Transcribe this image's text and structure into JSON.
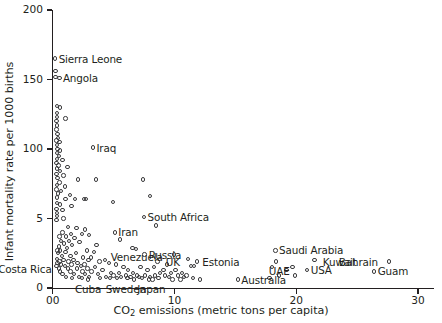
{
  "chart_data": {
    "type": "scatter",
    "title": "",
    "xlabel": "CO2 emissions (metric tons per capita)",
    "xlabel_main": "CO",
    "xlabel_sub": "2",
    "xlabel_rest": " emissions (metric tons per capita)",
    "ylabel": "Infant mortality rate per 1000 births",
    "xlim": [
      0,
      31.5
    ],
    "ylim": [
      0,
      212
    ],
    "grid": false,
    "legend": null,
    "marker": "open-circle",
    "marker_color": "#3a3a3c",
    "xticks": [
      0,
      10,
      20,
      30
    ],
    "xticklabels": [
      "00",
      "10",
      "20",
      "30"
    ],
    "yticks": [
      0,
      50,
      100,
      150,
      200
    ],
    "yticklabels": [
      "0",
      "5",
      "100",
      "150",
      "200"
    ],
    "annotations": [
      {
        "label": "Sierra Leone",
        "x": 0.2,
        "y": 165,
        "align": "right"
      },
      {
        "label": "Angola",
        "x": 0.55,
        "y": 151,
        "align": "right"
      },
      {
        "label": "Iraq",
        "x": 3.3,
        "y": 101,
        "align": "right"
      },
      {
        "label": "South Africa",
        "x": 7.5,
        "y": 51,
        "align": "right"
      },
      {
        "label": "Iran",
        "x": 5.1,
        "y": 40,
        "align": "right"
      },
      {
        "label": "Venezuela",
        "x": 6.9,
        "y": 29,
        "align": "below"
      },
      {
        "label": "Russia",
        "x": 7.6,
        "y": 24,
        "align": "right"
      },
      {
        "label": "UK",
        "x": 9.0,
        "y": 19,
        "align": "right"
      },
      {
        "label": "Estonia",
        "x": 12.0,
        "y": 19,
        "align": "right"
      },
      {
        "label": "Saudi Arabia",
        "x": 18.3,
        "y": 27,
        "align": "right"
      },
      {
        "label": "UAE",
        "x": 18.6,
        "y": 19,
        "align": "below"
      },
      {
        "label": "USA",
        "x": 20.9,
        "y": 13,
        "align": "right"
      },
      {
        "label": "Kuwait",
        "x": 21.9,
        "y": 19,
        "align": "right"
      },
      {
        "label": "Bahrain",
        "x": 27.0,
        "y": 19,
        "align": "left"
      },
      {
        "label": "Guam",
        "x": 26.4,
        "y": 12,
        "align": "right"
      },
      {
        "label": "Costa Rica",
        "x": 0.2,
        "y": 14,
        "align": "left"
      },
      {
        "label": "Cuba",
        "x": 2.9,
        "y": 6,
        "align": "below"
      },
      {
        "label": "Sweden",
        "x": 6.0,
        "y": 6,
        "align": "below"
      },
      {
        "label": "Japan",
        "x": 8.1,
        "y": 6,
        "align": "below"
      },
      {
        "label": "Australia",
        "x": 15.2,
        "y": 6,
        "align": "right"
      }
    ],
    "points": [
      {
        "x": 0.2,
        "y": 165
      },
      {
        "x": 0.22,
        "y": 156
      },
      {
        "x": 0.22,
        "y": 152
      },
      {
        "x": 0.55,
        "y": 151
      },
      {
        "x": 0.35,
        "y": 131
      },
      {
        "x": 0.6,
        "y": 130
      },
      {
        "x": 0.33,
        "y": 126
      },
      {
        "x": 0.35,
        "y": 123
      },
      {
        "x": 1.05,
        "y": 122
      },
      {
        "x": 0.32,
        "y": 120
      },
      {
        "x": 0.36,
        "y": 117
      },
      {
        "x": 0.3,
        "y": 114
      },
      {
        "x": 0.38,
        "y": 111
      },
      {
        "x": 0.42,
        "y": 108
      },
      {
        "x": 0.3,
        "y": 106
      },
      {
        "x": 0.55,
        "y": 105
      },
      {
        "x": 0.34,
        "y": 103
      },
      {
        "x": 3.3,
        "y": 101
      },
      {
        "x": 0.4,
        "y": 100
      },
      {
        "x": 0.62,
        "y": 99
      },
      {
        "x": 0.33,
        "y": 97
      },
      {
        "x": 0.5,
        "y": 95
      },
      {
        "x": 0.36,
        "y": 93
      },
      {
        "x": 0.8,
        "y": 92
      },
      {
        "x": 0.3,
        "y": 90
      },
      {
        "x": 0.48,
        "y": 88
      },
      {
        "x": 1.2,
        "y": 87
      },
      {
        "x": 0.35,
        "y": 86
      },
      {
        "x": 0.6,
        "y": 84
      },
      {
        "x": 0.32,
        "y": 82
      },
      {
        "x": 0.9,
        "y": 81
      },
      {
        "x": 0.38,
        "y": 79
      },
      {
        "x": 2.1,
        "y": 78
      },
      {
        "x": 3.55,
        "y": 78
      },
      {
        "x": 7.4,
        "y": 78
      },
      {
        "x": 0.55,
        "y": 76
      },
      {
        "x": 0.34,
        "y": 74
      },
      {
        "x": 1.0,
        "y": 73
      },
      {
        "x": 0.3,
        "y": 71
      },
      {
        "x": 0.7,
        "y": 70
      },
      {
        "x": 0.42,
        "y": 68
      },
      {
        "x": 1.4,
        "y": 67
      },
      {
        "x": 8.0,
        "y": 66
      },
      {
        "x": 0.33,
        "y": 65
      },
      {
        "x": 1.05,
        "y": 64
      },
      {
        "x": 1.85,
        "y": 64
      },
      {
        "x": 2.55,
        "y": 64
      },
      {
        "x": 2.75,
        "y": 64
      },
      {
        "x": 4.95,
        "y": 62
      },
      {
        "x": 0.36,
        "y": 61
      },
      {
        "x": 0.6,
        "y": 60
      },
      {
        "x": 1.55,
        "y": 59
      },
      {
        "x": 0.32,
        "y": 57
      },
      {
        "x": 0.8,
        "y": 56
      },
      {
        "x": 0.34,
        "y": 54
      },
      {
        "x": 0.36,
        "y": 52
      },
      {
        "x": 7.5,
        "y": 51
      },
      {
        "x": 0.9,
        "y": 50
      },
      {
        "x": 0.3,
        "y": 49
      },
      {
        "x": 8.5,
        "y": 45
      },
      {
        "x": 1.25,
        "y": 44
      },
      {
        "x": 1.95,
        "y": 43
      },
      {
        "x": 2.65,
        "y": 42
      },
      {
        "x": 5.1,
        "y": 40
      },
      {
        "x": 0.8,
        "y": 40
      },
      {
        "x": 1.5,
        "y": 39
      },
      {
        "x": 2.4,
        "y": 39
      },
      {
        "x": 3.0,
        "y": 38
      },
      {
        "x": 0.55,
        "y": 37
      },
      {
        "x": 1.1,
        "y": 37
      },
      {
        "x": 1.8,
        "y": 36
      },
      {
        "x": 5.55,
        "y": 35
      },
      {
        "x": 0.7,
        "y": 34
      },
      {
        "x": 1.35,
        "y": 34
      },
      {
        "x": 2.2,
        "y": 33
      },
      {
        "x": 0.95,
        "y": 32
      },
      {
        "x": 1.6,
        "y": 31
      },
      {
        "x": 3.6,
        "y": 31
      },
      {
        "x": 0.5,
        "y": 30
      },
      {
        "x": 1.15,
        "y": 29
      },
      {
        "x": 6.55,
        "y": 29
      },
      {
        "x": 6.85,
        "y": 28
      },
      {
        "x": 0.38,
        "y": 27
      },
      {
        "x": 0.62,
        "y": 27
      },
      {
        "x": 2.8,
        "y": 27
      },
      {
        "x": 18.3,
        "y": 27
      },
      {
        "x": 1.05,
        "y": 26
      },
      {
        "x": 3.4,
        "y": 26
      },
      {
        "x": 0.45,
        "y": 25
      },
      {
        "x": 1.9,
        "y": 25
      },
      {
        "x": 7.55,
        "y": 24
      },
      {
        "x": 9.95,
        "y": 24
      },
      {
        "x": 0.75,
        "y": 23
      },
      {
        "x": 1.45,
        "y": 23
      },
      {
        "x": 2.5,
        "y": 22
      },
      {
        "x": 3.15,
        "y": 22
      },
      {
        "x": 11.1,
        "y": 21
      },
      {
        "x": 0.35,
        "y": 21
      },
      {
        "x": 0.9,
        "y": 20
      },
      {
        "x": 1.7,
        "y": 20
      },
      {
        "x": 2.95,
        "y": 20
      },
      {
        "x": 4.3,
        "y": 20
      },
      {
        "x": 21.5,
        "y": 20
      },
      {
        "x": 0.55,
        "y": 19
      },
      {
        "x": 1.3,
        "y": 19
      },
      {
        "x": 3.85,
        "y": 19
      },
      {
        "x": 8.6,
        "y": 19
      },
      {
        "x": 11.85,
        "y": 19
      },
      {
        "x": 18.35,
        "y": 19
      },
      {
        "x": 27.6,
        "y": 19
      },
      {
        "x": 0.4,
        "y": 18
      },
      {
        "x": 2.05,
        "y": 18
      },
      {
        "x": 4.6,
        "y": 18
      },
      {
        "x": 0.68,
        "y": 17
      },
      {
        "x": 1.55,
        "y": 17
      },
      {
        "x": 2.6,
        "y": 17
      },
      {
        "x": 5.2,
        "y": 17
      },
      {
        "x": 9.4,
        "y": 17
      },
      {
        "x": 11.35,
        "y": 16
      },
      {
        "x": 11.6,
        "y": 16
      },
      {
        "x": 0.3,
        "y": 16
      },
      {
        "x": 1.0,
        "y": 16
      },
      {
        "x": 2.3,
        "y": 16
      },
      {
        "x": 3.45,
        "y": 15
      },
      {
        "x": 5.8,
        "y": 15
      },
      {
        "x": 7.2,
        "y": 15
      },
      {
        "x": 8.3,
        "y": 15
      },
      {
        "x": 18.0,
        "y": 15
      },
      {
        "x": 19.7,
        "y": 15
      },
      {
        "x": 0.5,
        "y": 14
      },
      {
        "x": 1.25,
        "y": 14
      },
      {
        "x": 2.0,
        "y": 14
      },
      {
        "x": 2.85,
        "y": 14
      },
      {
        "x": 4.1,
        "y": 13
      },
      {
        "x": 6.2,
        "y": 13
      },
      {
        "x": 7.8,
        "y": 13
      },
      {
        "x": 9.1,
        "y": 13
      },
      {
        "x": 10.1,
        "y": 13
      },
      {
        "x": 19.2,
        "y": 13
      },
      {
        "x": 20.9,
        "y": 13
      },
      {
        "x": 26.4,
        "y": 12
      },
      {
        "x": 0.62,
        "y": 12
      },
      {
        "x": 1.45,
        "y": 12
      },
      {
        "x": 2.45,
        "y": 12
      },
      {
        "x": 3.2,
        "y": 12
      },
      {
        "x": 4.8,
        "y": 11
      },
      {
        "x": 5.45,
        "y": 11
      },
      {
        "x": 6.6,
        "y": 11
      },
      {
        "x": 8.8,
        "y": 11
      },
      {
        "x": 9.7,
        "y": 11
      },
      {
        "x": 10.6,
        "y": 11
      },
      {
        "x": 0.8,
        "y": 10
      },
      {
        "x": 1.75,
        "y": 10
      },
      {
        "x": 2.65,
        "y": 10
      },
      {
        "x": 3.7,
        "y": 10
      },
      {
        "x": 5.0,
        "y": 9
      },
      {
        "x": 6.0,
        "y": 9
      },
      {
        "x": 6.9,
        "y": 9
      },
      {
        "x": 7.6,
        "y": 9
      },
      {
        "x": 8.4,
        "y": 9
      },
      {
        "x": 9.2,
        "y": 9
      },
      {
        "x": 10.3,
        "y": 9
      },
      {
        "x": 11.0,
        "y": 9
      },
      {
        "x": 18.6,
        "y": 9
      },
      {
        "x": 19.9,
        "y": 9
      },
      {
        "x": 1.1,
        "y": 8
      },
      {
        "x": 2.15,
        "y": 8
      },
      {
        "x": 3.0,
        "y": 8
      },
      {
        "x": 4.4,
        "y": 8
      },
      {
        "x": 5.6,
        "y": 8
      },
      {
        "x": 6.4,
        "y": 8
      },
      {
        "x": 7.1,
        "y": 8
      },
      {
        "x": 8.0,
        "y": 8
      },
      {
        "x": 9.55,
        "y": 8
      },
      {
        "x": 10.8,
        "y": 8
      },
      {
        "x": 11.5,
        "y": 7
      },
      {
        "x": 15.2,
        "y": 6
      },
      {
        "x": 17.8,
        "y": 7
      },
      {
        "x": 1.6,
        "y": 7
      },
      {
        "x": 2.4,
        "y": 7
      },
      {
        "x": 3.9,
        "y": 7
      },
      {
        "x": 4.7,
        "y": 7
      },
      {
        "x": 5.3,
        "y": 7
      },
      {
        "x": 6.15,
        "y": 7
      },
      {
        "x": 7.35,
        "y": 7
      },
      {
        "x": 8.7,
        "y": 7
      },
      {
        "x": 9.85,
        "y": 6
      },
      {
        "x": 12.1,
        "y": 6
      },
      {
        "x": 2.9,
        "y": 6
      },
      {
        "x": 6.7,
        "y": 6
      },
      {
        "x": 7.9,
        "y": 6
      },
      {
        "x": 8.2,
        "y": 6
      },
      {
        "x": 10.5,
        "y": 6
      }
    ]
  }
}
